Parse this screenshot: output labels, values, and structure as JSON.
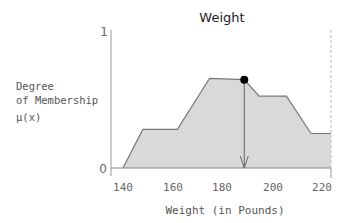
{
  "chart_data": {
    "type": "area",
    "title": "Weight",
    "xlabel": "Weight (in Pounds)",
    "ylabel_lines": [
      "Degree",
      "of Membership",
      "μ(x)"
    ],
    "xlim": [
      140,
      224
    ],
    "ylim": [
      0,
      1
    ],
    "xticks": [
      140,
      160,
      180,
      200,
      220
    ],
    "yticks": [
      0,
      1
    ],
    "x": [
      140,
      148,
      162,
      175,
      189,
      195,
      206,
      216,
      224
    ],
    "values": [
      0,
      0.28,
      0.28,
      0.65,
      0.64,
      0.52,
      0.52,
      0.25,
      0.25
    ],
    "annotations": [
      {
        "type": "point",
        "x": 189,
        "y": 0.64,
        "label": "marked membership point"
      },
      {
        "type": "arrow",
        "from": [
          189,
          0.64
        ],
        "to": [
          189,
          0
        ],
        "label": "projection to x-axis"
      },
      {
        "type": "dashed-vline",
        "x": 224
      }
    ],
    "grid": false,
    "legend": null
  },
  "colors": {
    "fill": "#d9d9d9",
    "stroke": "#777777",
    "axis": "#888888",
    "point": "#000000"
  },
  "labels": {
    "title": "Weight",
    "y_max": "1",
    "y_min": "0",
    "ylabel_1": "Degree",
    "ylabel_2": "of Membership",
    "ylabel_3": "μ(x)",
    "xlabel": "Weight (in Pounds)",
    "xtick_0": "140",
    "xtick_1": "160",
    "xtick_2": "180",
    "xtick_3": "200",
    "xtick_4": "220"
  }
}
